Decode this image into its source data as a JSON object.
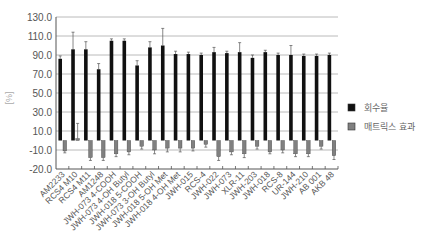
{
  "chart_data": {
    "type": "bar",
    "title": "",
    "xlabel": "",
    "ylabel": "[%]",
    "ylim": [
      -20,
      130
    ],
    "y_ticks": [
      "130.0",
      "110.0",
      "90.0",
      "70.0",
      "50.0",
      "30.0",
      "10.0",
      "-10.0",
      "-20.0"
    ],
    "grid": true,
    "legend_position": "right",
    "categories": [
      "AM2233",
      "RCS4 M10",
      "RCS4 M11",
      "AM1248",
      "JWH-073 4-COOH",
      "JWH-073 4-OH Butyl",
      "JWH-018 5-COOH",
      "JWH-073 3-OH Butyl",
      "JWH-018 5-OH Met",
      "JWH-018 4-OH Met",
      "JWH-015",
      "RCS-4",
      "JWH-022",
      "JWH-073",
      "XLR-11",
      "JWH-203",
      "JWH-018",
      "RCS-8",
      "UR-144",
      "JWH-210",
      "AB 001",
      "AKB 48"
    ],
    "series": [
      {
        "name": "회수율",
        "color": "#111111",
        "values": [
          86,
          96,
          96,
          75,
          105,
          105,
          79,
          98,
          100,
          91,
          91,
          90,
          93,
          92,
          93,
          87,
          93,
          90,
          90,
          89,
          89,
          90
        ],
        "errors": [
          3,
          18,
          8,
          6,
          2,
          2,
          5,
          6,
          18,
          3,
          2,
          2,
          5,
          2,
          10,
          3,
          2,
          2,
          10,
          2,
          2,
          2
        ]
      },
      {
        "name": "매트릭스 효과",
        "color": "#808080",
        "values": [
          -11,
          2,
          -18,
          -18,
          -14,
          -12,
          -6,
          -10,
          -8,
          -8,
          -8,
          -4,
          -17,
          -12,
          -14,
          -6,
          -12,
          -10,
          -14,
          -14,
          -6,
          -16
        ],
        "errors": [
          2,
          16,
          3,
          3,
          3,
          3,
          3,
          4,
          4,
          4,
          3,
          3,
          4,
          3,
          4,
          3,
          2,
          3,
          3,
          3,
          3,
          4
        ]
      }
    ]
  },
  "legend": {
    "items": [
      {
        "label": "회수율",
        "color": "#111111"
      },
      {
        "label": "매트릭스 효과",
        "color": "#808080"
      }
    ]
  }
}
